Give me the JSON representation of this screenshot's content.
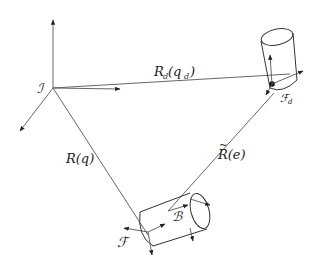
{
  "diagram": {
    "labels": {
      "inertial_frame": "ℐ",
      "desired_pose": "R",
      "desired_pose_sub": "d",
      "desired_pose_arg_open": "(q",
      "desired_pose_arg_sub": "d",
      "desired_pose_arg_close": ")",
      "actual_pose": "R(q)",
      "error_pose": "R(e)",
      "error_tilde": "~",
      "body_frame": "ℬ",
      "frame_f": "ℱ",
      "frame_fd": "ℱ",
      "frame_fd_sub": "d"
    },
    "colors": {
      "line": "#555555",
      "ink": "#222222",
      "background": "#ffffff"
    }
  }
}
